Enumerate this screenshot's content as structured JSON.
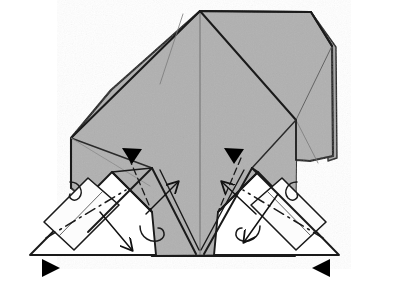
{
  "figure": {
    "type": "origami-fold-diagram",
    "canvas": {
      "width": 403,
      "height": 287,
      "background": "#ffffff"
    },
    "colors": {
      "paper_front": "#b0b0b0",
      "paper_back": "#ffffff",
      "outline": "#1a1a1a",
      "crease": "#4a4a4a",
      "arrow": "#111111",
      "arrowhead_fill": "#000000",
      "shadow": "#8a8a8a"
    },
    "stroke_widths": {
      "outline": 2.1,
      "edge": 1.5,
      "crease": 1.0,
      "arrow": 1.4,
      "dashed": 1.4
    },
    "shapes": {
      "main_body_label": "main-paper-body",
      "main_body_points": "200,11 311,12 332,46 333,156 310,161 295,255 152,256 72,188 71,138 111,90",
      "upper_left_panel_points": "200,11 71,138 71,188 152,256 200,256",
      "upper_right_panel_points": "200,11 311,12 332,46 333,156 310,161 295,255 200,256",
      "right_flank_points": "311,12 332,46 333,156 300,160 296,120",
      "left_white_flap_points": "30,255 112,172 152,212 70,255",
      "right_white_flap_points": "339,255 258,172 218,212 298,255",
      "left_flap_triangle_points": "30,255 112,172 152,212",
      "right_flap_triangle_points": "339,255 258,172 218,212"
    },
    "creases": [
      {
        "name": "center-vertical-crease",
        "from": "200,11",
        "to": "200,256",
        "style": "thin"
      },
      {
        "name": "upper-left-diagonal",
        "from": "200,11",
        "to": "71,138",
        "style": "outline"
      },
      {
        "name": "upper-right-diagonal",
        "from": "200,11",
        "to": "296,120",
        "style": "outline"
      },
      {
        "name": "right-inner-diagonal",
        "from": "296,120",
        "to": "332,46",
        "style": "thin"
      },
      {
        "name": "left-edge-vertical",
        "from": "71,138",
        "to": "71,188",
        "style": "outline"
      },
      {
        "name": "right-edge-vertical",
        "from": "296,120",
        "to": "296,160",
        "style": "outline"
      },
      {
        "name": "bottom-edge",
        "from": "152,256",
        "to": "295,256",
        "style": "outline"
      },
      {
        "name": "left-lower-diagonal",
        "from": "71,188",
        "to": "152,256",
        "style": "outline"
      },
      {
        "name": "right-lower-diagonal",
        "from": "296,160",
        "to": "295,256",
        "style": "outline"
      }
    ],
    "fold_lines_dashed": [
      {
        "name": "left-flap-dash-dot-crease",
        "from": "48,237",
        "to": "128,188"
      },
      {
        "name": "right-flap-dash-dot-crease",
        "from": "320,237",
        "to": "240,188"
      },
      {
        "name": "left-inner-dashed-crease",
        "from": "128,157",
        "to": "152,212"
      },
      {
        "name": "right-inner-dashed-crease",
        "from": "240,157",
        "to": "218,212"
      }
    ],
    "arrowheads_solid": [
      {
        "name": "fold-arrowhead-upper-left",
        "x": 132,
        "y": 152,
        "direction": "down",
        "size": 11
      },
      {
        "name": "fold-arrowhead-upper-right",
        "x": 234,
        "y": 152,
        "direction": "down",
        "size": 11
      },
      {
        "name": "fold-arrowhead-lower-left",
        "x": 50,
        "y": 265,
        "direction": "right",
        "size": 10
      },
      {
        "name": "fold-arrowhead-lower-right",
        "x": 320,
        "y": 265,
        "direction": "left",
        "size": 10
      }
    ],
    "motion_arrows": [
      {
        "name": "center-left-up-arrow",
        "from": "150,212",
        "to": "176,182",
        "head": "open"
      },
      {
        "name": "center-right-up-arrow",
        "from": "252,212",
        "to": "224,182",
        "head": "open"
      },
      {
        "name": "left-outward-arrow",
        "from": "98,212",
        "to": "130,248",
        "head": "open"
      },
      {
        "name": "right-inward-arrow",
        "from": "276,196",
        "to": "244,240",
        "head": "open"
      }
    ],
    "tuck_arcs": [
      {
        "name": "left-tuck-arc",
        "cx": 76,
        "cy": 190,
        "rx": 10,
        "ry": 9
      },
      {
        "name": "center-left-tuck-arc",
        "cx": 158,
        "cy": 235,
        "rx": 12,
        "ry": 9
      },
      {
        "name": "center-right-tuck-arc",
        "cx": 242,
        "cy": 235,
        "rx": 12,
        "ry": 9
      },
      {
        "name": "right-tuck-arc",
        "cx": 290,
        "cy": 190,
        "rx": 10,
        "ry": 9
      }
    ]
  }
}
